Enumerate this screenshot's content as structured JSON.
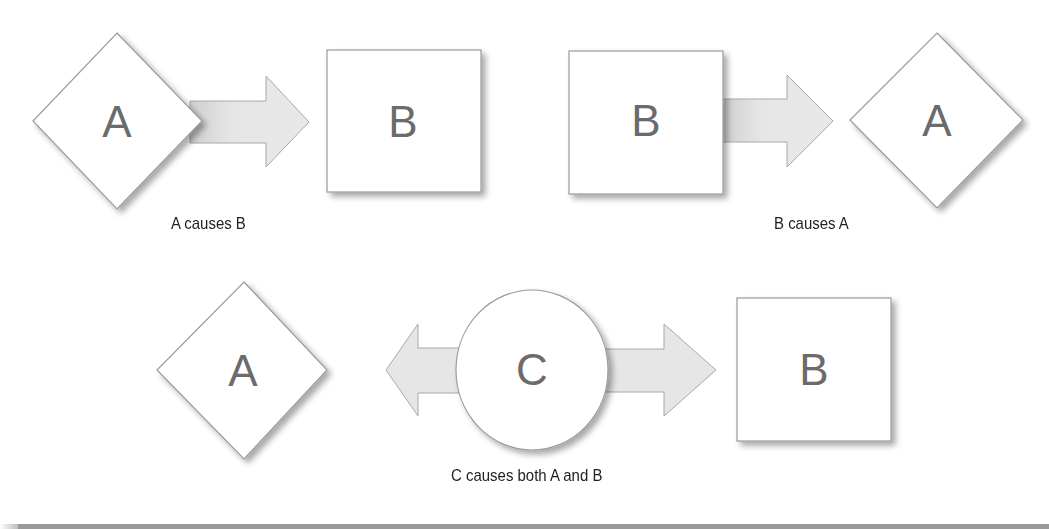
{
  "diagram": {
    "panels": [
      {
        "id": "a-causes-b",
        "caption": "A causes B",
        "nodes": [
          {
            "shape": "diamond",
            "label": "A"
          },
          {
            "shape": "square",
            "label": "B"
          }
        ],
        "arrows": [
          {
            "from": "A",
            "to": "B",
            "direction": "right"
          }
        ]
      },
      {
        "id": "b-causes-a",
        "caption": "B causes A",
        "nodes": [
          {
            "shape": "square",
            "label": "B"
          },
          {
            "shape": "diamond",
            "label": "A"
          }
        ],
        "arrows": [
          {
            "from": "B",
            "to": "A",
            "direction": "right"
          }
        ]
      },
      {
        "id": "c-causes-both",
        "caption": "C causes both A and B",
        "nodes": [
          {
            "shape": "diamond",
            "label": "A"
          },
          {
            "shape": "circle",
            "label": "C"
          },
          {
            "shape": "square",
            "label": "B"
          }
        ],
        "arrows": [
          {
            "from": "C",
            "to": "A",
            "direction": "left"
          },
          {
            "from": "C",
            "to": "B",
            "direction": "right"
          }
        ]
      }
    ],
    "colors": {
      "node_fill": "#ffffff",
      "node_stroke": "#9a9a9a",
      "arrow_fill": "#e6e6e6",
      "arrow_stroke": "#a8a8a8",
      "label_color": "#6b6b6b",
      "caption_color": "#222222"
    }
  }
}
